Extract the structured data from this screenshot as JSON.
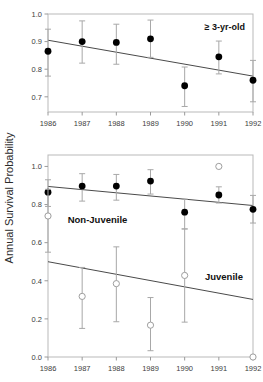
{
  "figure": {
    "ylabel": "Annual Survival Probability",
    "xticks": [
      "1986",
      "1987",
      "1988",
      "1989",
      "1990",
      "1991",
      "1992"
    ]
  },
  "chart_data": [
    {
      "type": "scatter",
      "panel": "top",
      "annotation": "≥ 3-yr-old",
      "title": "",
      "xlabel": "",
      "ylabel": "Annual Survival Probability",
      "x": [
        1986,
        1987,
        1988,
        1989,
        1990,
        1991,
        1992
      ],
      "categories": [
        "1986",
        "1987",
        "1988",
        "1989",
        "1990",
        "1991",
        "1992"
      ],
      "ylim": [
        0.645,
        1.0
      ],
      "yticks": [
        0.7,
        0.8,
        0.9,
        1.0
      ],
      "ytick_labels": [
        "0.7",
        "0.8",
        "0.9",
        "1.0"
      ],
      "grid": false,
      "legend": "none",
      "series": [
        {
          "name": "≥ 3-yr-old",
          "marker": "filled-circle",
          "values": [
            0.865,
            0.9,
            0.897,
            0.91,
            0.74,
            0.845,
            0.76
          ],
          "err_low": [
            0.775,
            0.822,
            0.818,
            0.843,
            0.665,
            0.783,
            0.682
          ],
          "err_high": [
            0.945,
            0.975,
            0.963,
            0.978,
            0.808,
            0.902,
            0.832
          ]
        }
      ],
      "trendline": {
        "name": "≥ 3-yr-old fit",
        "y_start": 0.905,
        "y_end": 0.775
      }
    },
    {
      "type": "scatter",
      "panel": "bottom",
      "annotation": "",
      "title": "",
      "xlabel": "",
      "ylabel": "Annual Survival Probability",
      "x": [
        1986,
        1987,
        1988,
        1989,
        1990,
        1991,
        1992
      ],
      "categories": [
        "1986",
        "1987",
        "1988",
        "1989",
        "1990",
        "1991",
        "1992"
      ],
      "ylim": [
        0.0,
        1.06
      ],
      "yticks": [
        0.0,
        0.2,
        0.4,
        0.6,
        0.8,
        1.0
      ],
      "ytick_labels": [
        "0.0",
        "0.2",
        "0.4",
        "0.6",
        "0.8",
        "1.0"
      ],
      "grid": false,
      "legend": "inline-labels",
      "series": [
        {
          "name": "Non-Juvenile",
          "marker": "filled-circle",
          "values": [
            0.865,
            0.897,
            0.897,
            0.923,
            0.76,
            0.85,
            0.775
          ],
          "err_low": [
            0.79,
            0.818,
            0.823,
            0.855,
            0.672,
            0.808,
            0.703
          ],
          "err_high": [
            0.93,
            0.962,
            0.958,
            0.983,
            0.828,
            0.893,
            0.848
          ]
        },
        {
          "name": "Juvenile",
          "marker": "open-circle",
          "values": [
            0.74,
            0.318,
            0.385,
            0.167,
            0.428,
            1.0,
            0.0
          ],
          "err_low": [
            0.55,
            0.15,
            0.185,
            0.033,
            0.183,
            1.0,
            0.0
          ],
          "err_high": [
            0.88,
            0.47,
            0.578,
            0.312,
            0.672,
            1.0,
            0.0
          ]
        }
      ],
      "trendline_nonjuvenile": {
        "name": "Non-Juvenile fit",
        "y_start": 0.895,
        "y_end": 0.795
      },
      "trendline_juvenile": {
        "name": "Juvenile fit",
        "y_start": 0.5,
        "y_end": 0.302
      },
      "labels": [
        {
          "text": "Non-Juvenile",
          "x": 1987.45,
          "y": 0.705
        },
        {
          "text": "Juvenile",
          "x": 1991.15,
          "y": 0.405
        }
      ]
    }
  ]
}
